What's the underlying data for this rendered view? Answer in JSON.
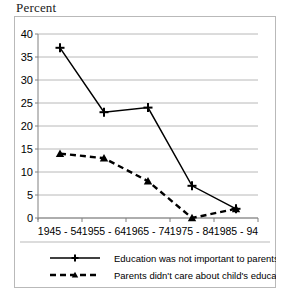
{
  "chart_data": {
    "type": "line",
    "title": "Percent",
    "xlabel": "",
    "ylabel": "",
    "ylim": [
      0,
      40
    ],
    "yticks": [
      0,
      5,
      10,
      15,
      20,
      25,
      30,
      35,
      40
    ],
    "grid": true,
    "legend_position": "bottom",
    "categories": [
      "1945 - 54",
      "1955 - 64",
      "1965 - 74",
      "1975 - 84",
      "1985 - 94"
    ],
    "series": [
      {
        "name": "Education was not important to parents",
        "values": [
          37,
          23,
          24,
          7,
          2
        ],
        "style": "solid",
        "marker": "plus",
        "color": "#000000"
      },
      {
        "name": "Parents  didn't care about child's education",
        "values": [
          14,
          13,
          8,
          0,
          2
        ],
        "style": "dashed",
        "marker": "triangle",
        "color": "#000000"
      }
    ]
  },
  "axis": {
    "y_tick_labels": [
      "40",
      "35",
      "30",
      "25",
      "20",
      "15",
      "10",
      "5",
      "0"
    ],
    "x_tick_labels": [
      "1945 - 54",
      "1955 - 64",
      "1965 - 74",
      "1975 - 84",
      "1985 - 94"
    ]
  },
  "legend": {
    "entries": [
      {
        "label": "Education was not important to parents"
      },
      {
        "label": "Parents  didn't care about child's education"
      }
    ]
  },
  "colors": {
    "series_line": "#000000",
    "gridline": "#a6a6a6",
    "frame": "#b9b9b9",
    "background": "#ffffff",
    "text": "#000000"
  }
}
